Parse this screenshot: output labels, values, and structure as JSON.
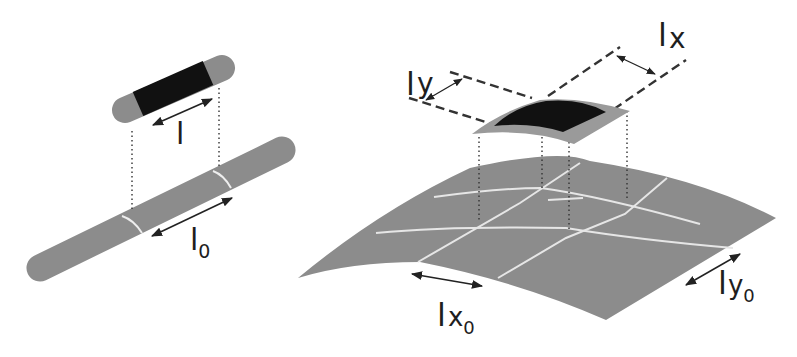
{
  "colors": {
    "background": "#ffffff",
    "substrate": "#8c8c8c",
    "tile_dark": "#111111",
    "grid_line": "#e6e6e6",
    "guide_line": "#333333",
    "label": "#1e1e1e"
  },
  "left_panel": {
    "description": "1D fiber: element of length l lifted from a rod with reference length l0",
    "labels": {
      "deformed_length": {
        "base": "l",
        "sub": ""
      },
      "reference_length": {
        "base": "l",
        "sub": "0"
      }
    }
  },
  "right_panel": {
    "description": "2D sheet: curved patch with sides lx, ly lifted from a gridded surface with reference sides lx0, ly0",
    "labels": {
      "deformed_x": {
        "base": "l",
        "sub": "x"
      },
      "deformed_y": {
        "base": "l",
        "sub": "y"
      },
      "reference_x": {
        "base": "l",
        "sub": "x",
        "subsub": "0"
      },
      "reference_y": {
        "base": "l",
        "sub": "y",
        "subsub": "0"
      }
    }
  }
}
